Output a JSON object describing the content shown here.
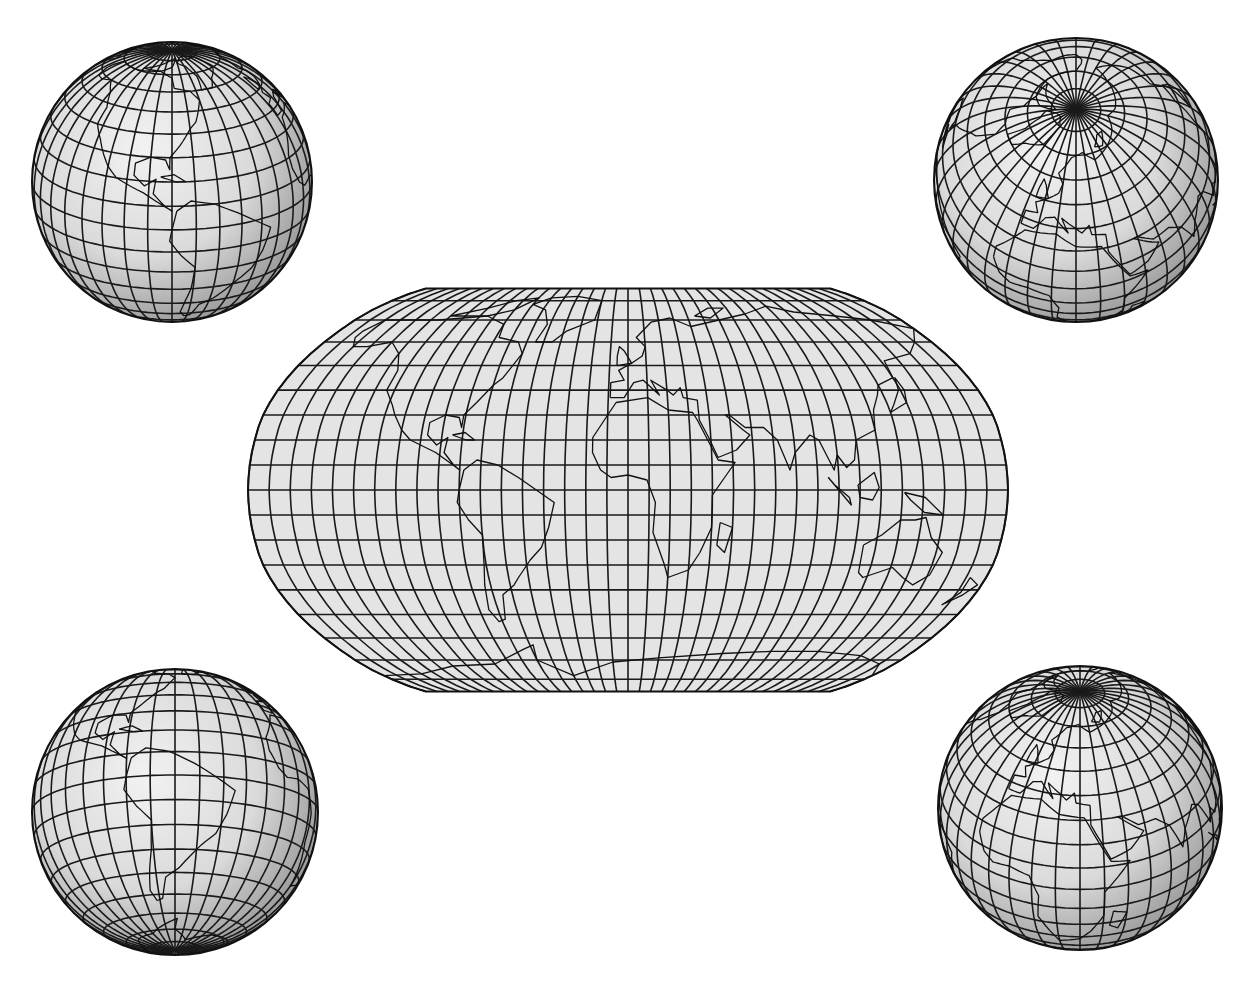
{
  "figure": {
    "background": "#ffffff",
    "ink_color": "#1a1a1a",
    "fill_color": "#e4e4e4"
  },
  "world_map": {
    "projection": "Robinson",
    "graticule_step_deg": 10,
    "bounds": {
      "left": 248,
      "right": 1008,
      "top": 287,
      "bottom": 690,
      "equator_y": 490,
      "center_x": 628
    },
    "flat_top": {
      "x1": 430,
      "x2": 830
    },
    "flat_bottom": {
      "x1": 420,
      "x2": 840
    }
  },
  "globes": [
    {
      "id": "americas-north",
      "position": "top-left",
      "cx": 172,
      "cy": 182,
      "r": 140,
      "center_lon": -80,
      "center_lat": 20
    },
    {
      "id": "arctic",
      "position": "top-right",
      "cx": 1076,
      "cy": 180,
      "r": 142,
      "center_lon": 20,
      "center_lat": 60
    },
    {
      "id": "americas-south",
      "position": "bottom-left",
      "cx": 175,
      "cy": 812,
      "r": 143,
      "center_lon": -60,
      "center_lat": -15
    },
    {
      "id": "eurasia-africa",
      "position": "bottom-right",
      "cx": 1080,
      "cy": 808,
      "r": 142,
      "center_lon": 30,
      "center_lat": 35
    }
  ]
}
